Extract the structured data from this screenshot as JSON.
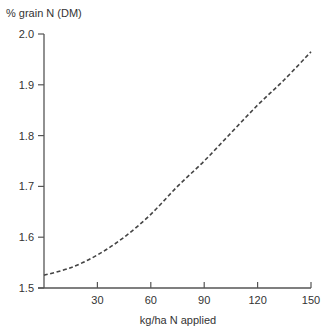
{
  "chart_data": {
    "type": "line",
    "title": "",
    "ylabel": "% grain N (DM)",
    "xlabel": "kg/ha N applied",
    "xlim": [
      0,
      150
    ],
    "ylim": [
      1.5,
      2.0
    ],
    "xticks": [
      30,
      60,
      90,
      120,
      150
    ],
    "yticks": [
      "1.5",
      "1.6",
      "1.7",
      "1.8",
      "1.9",
      "2.0"
    ],
    "grid": false,
    "legend": null,
    "series": [
      {
        "name": "grain N response",
        "style": "dashed",
        "x": [
          0,
          15,
          30,
          45,
          60,
          75,
          90,
          105,
          120,
          135,
          150
        ],
        "y": [
          1.525,
          1.54,
          1.565,
          1.6,
          1.645,
          1.7,
          1.75,
          1.805,
          1.86,
          1.91,
          1.965
        ]
      }
    ]
  }
}
